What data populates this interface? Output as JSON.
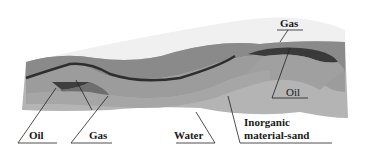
{
  "diagram": {
    "type": "geological cross-section",
    "colors": {
      "sky": "#f2f2f2",
      "top_layer": "#9a9a9a",
      "cap_rock": "#7c7c7c",
      "seam": "#333333",
      "reservoir_dark": "#4a4a4a",
      "sand_mid": "#a8a8a8",
      "base": "#b4b4b4",
      "label_line": "#222222"
    },
    "labels": {
      "gas_top": "Gas",
      "oil_right": "Oil",
      "oil_left": "Oil",
      "gas_left": "Gas",
      "water": "Water",
      "inorganic_line1": "Inorganic",
      "inorganic_line2": "material-sand"
    }
  }
}
